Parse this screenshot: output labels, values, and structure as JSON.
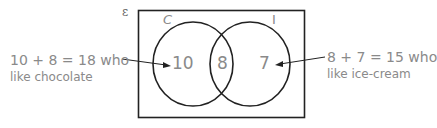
{
  "diagram": {
    "universal_symbol": "ε",
    "sets": [
      {
        "label": "C",
        "only_count": "10"
      },
      {
        "label": "I",
        "only_count": "7"
      }
    ],
    "intersection_count": "8",
    "annotations": {
      "left": {
        "line1": "10 + 8 = 18 who",
        "line2": "like chocolate"
      },
      "right": {
        "line1": "8 + 7 = 15 who",
        "line2": "like ice-cream"
      }
    },
    "colors": {
      "stroke": "#222222",
      "text": "#8a8a8a"
    }
  }
}
